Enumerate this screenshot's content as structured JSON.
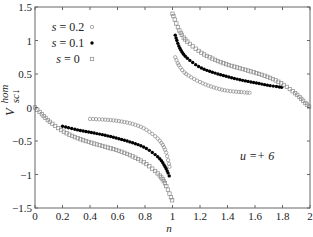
{
  "chart_data": {
    "type": "scatter",
    "title": "",
    "xlabel": "n",
    "ylabel": "V_{sc↓}^{hom}",
    "xlim": [
      0,
      2
    ],
    "ylim": [
      -1.5,
      1.5
    ],
    "xticks": [
      "0",
      "0.2",
      "0.4",
      "0.6",
      "0.8",
      "1",
      "1.2",
      "1.4",
      "1.6",
      "1.8",
      "2"
    ],
    "yticks": [
      "−1.5",
      "−1",
      "−0.5",
      "0",
      "0.5",
      "1",
      "1.5"
    ],
    "grid": false,
    "legend_position": "upper left",
    "annotation": "u =+ 6",
    "series": [
      {
        "name": "s = 0.2",
        "marker": "open-circle",
        "color": "#888888",
        "segments": [
          {
            "x": [
              0.4,
              0.5,
              0.6,
              0.7,
              0.8,
              0.9,
              0.95,
              0.98
            ],
            "y": [
              -0.17,
              -0.18,
              -0.2,
              -0.24,
              -0.32,
              -0.48,
              -0.65,
              -0.9
            ]
          },
          {
            "x": [
              1.02,
              1.05,
              1.1,
              1.2,
              1.3,
              1.4,
              1.5,
              1.56
            ],
            "y": [
              0.75,
              0.62,
              0.5,
              0.38,
              0.3,
              0.25,
              0.23,
              0.22
            ]
          }
        ]
      },
      {
        "name": "s = 0.1",
        "marker": "filled-circle",
        "color": "#000000",
        "segments": [
          {
            "x": [
              0.2,
              0.3,
              0.4,
              0.5,
              0.6,
              0.7,
              0.8,
              0.9,
              0.95,
              0.98
            ],
            "y": [
              -0.28,
              -0.33,
              -0.37,
              -0.41,
              -0.46,
              -0.52,
              -0.6,
              -0.75,
              -0.9,
              -1.04
            ]
          },
          {
            "x": [
              1.02,
              1.05,
              1.1,
              1.2,
              1.3,
              1.4,
              1.5,
              1.6,
              1.7,
              1.8
            ],
            "y": [
              1.08,
              0.9,
              0.75,
              0.6,
              0.52,
              0.46,
              0.41,
              0.37,
              0.33,
              0.3
            ]
          }
        ]
      },
      {
        "name": "s = 0",
        "marker": "open-square",
        "color": "#888888",
        "segments": [
          {
            "x": [
              0,
              0.05,
              0.1,
              0.2,
              0.3,
              0.4,
              0.5,
              0.6,
              0.7,
              0.8,
              0.9,
              0.95,
              1.0
            ],
            "y": [
              0.0,
              -0.1,
              -0.2,
              -0.35,
              -0.45,
              -0.52,
              -0.58,
              -0.64,
              -0.72,
              -0.83,
              -1.0,
              -1.15,
              -1.4
            ]
          },
          {
            "x": [
              1.0,
              1.05,
              1.1,
              1.2,
              1.3,
              1.4,
              1.5,
              1.6,
              1.7,
              1.8,
              1.9,
              1.95,
              2.0
            ],
            "y": [
              1.4,
              1.15,
              1.0,
              0.83,
              0.72,
              0.64,
              0.58,
              0.52,
              0.45,
              0.35,
              0.2,
              0.1,
              0.0
            ]
          }
        ]
      }
    ]
  },
  "legend": {
    "items": [
      {
        "label": "s = 0.2",
        "marker": "open-circle"
      },
      {
        "label": "s = 0.1",
        "marker": "filled-circle"
      },
      {
        "label": "s = 0",
        "marker": "open-square"
      }
    ]
  },
  "labels": {
    "xlabel": "n",
    "ylabel_main": "V",
    "ylabel_sup": "hom",
    "ylabel_sub": "sc↓",
    "annotation": "u =+ 6"
  }
}
